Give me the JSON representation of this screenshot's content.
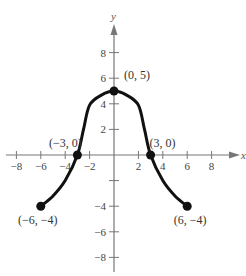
{
  "panel_label": "(c)",
  "chart_data": {
    "type": "line",
    "title": "",
    "xlabel": "x",
    "ylabel": "y",
    "xlim": [
      -9,
      9.5
    ],
    "ylim": [
      -9,
      10
    ],
    "grid": false,
    "x_ticks": [
      -8,
      -6,
      -4,
      -2,
      2,
      4,
      6,
      8
    ],
    "y_ticks": [
      -8,
      -6,
      -4,
      -2,
      2,
      4,
      6,
      8
    ],
    "x_tick_labels": [
      "−8",
      "−6",
      "−4",
      "−2",
      "2",
      "4",
      "6",
      "8"
    ],
    "y_tick_labels": [
      "−8",
      "−6",
      "−4",
      "",
      "2",
      "4",
      "6",
      "8"
    ],
    "series": [
      {
        "name": "f",
        "x": [
          -6,
          -5,
          -4,
          -3,
          -2.5,
          -2,
          -1,
          0,
          1,
          2,
          2.5,
          3,
          4,
          5,
          6
        ],
        "values": [
          -4,
          -3.2,
          -2,
          0,
          2,
          3.9,
          4.7,
          5,
          4.7,
          3.9,
          2,
          0,
          -2,
          -3.2,
          -4
        ]
      }
    ],
    "points": [
      {
        "x": -6,
        "y": -4,
        "label": "(−6, −4)"
      },
      {
        "x": -3,
        "y": 0,
        "label": "(−3, 0)"
      },
      {
        "x": 0,
        "y": 5,
        "label": "(0, 5)"
      },
      {
        "x": 3,
        "y": 0,
        "label": "(3, 0)"
      },
      {
        "x": 6,
        "y": -4,
        "label": "(6, −4)"
      }
    ]
  }
}
